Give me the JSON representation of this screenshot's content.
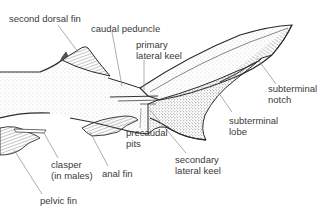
{
  "figure": {
    "labels": [
      {
        "id": "second-dorsal-fin",
        "text": "second dorsal fin",
        "x": 9,
        "y": 14
      },
      {
        "id": "caudal-peduncle",
        "text": "caudal peduncle",
        "x": 91,
        "y": 24
      },
      {
        "id": "primary-lateral-keel",
        "line1": "primary",
        "line2": "lateral keel",
        "x": 136,
        "y": 40
      },
      {
        "id": "subterminal-notch",
        "line1": "subterminal",
        "line2": "notch",
        "x": 268,
        "y": 84
      },
      {
        "id": "subterminal-lobe",
        "line1": "subterminal",
        "line2": "lobe",
        "x": 229,
        "y": 116
      },
      {
        "id": "precaudal-pits",
        "line1": "precaudal",
        "line2": "pits",
        "x": 126,
        "y": 128
      },
      {
        "id": "secondary-lateral-keel",
        "line1": "secondary",
        "line2": "lateral keel",
        "x": 175,
        "y": 155
      },
      {
        "id": "clasper",
        "line1": "clasper",
        "line2": "(in males)",
        "x": 51,
        "y": 160
      },
      {
        "id": "anal-fin",
        "text": "anal fin",
        "x": 102,
        "y": 169
      },
      {
        "id": "pelvic-fin",
        "text": "pelvic fin",
        "x": 40,
        "y": 196
      }
    ]
  },
  "colors": {
    "outline": "#2a2a2a",
    "label_text": "#3a3a3a",
    "leader_line": "#8a8a8a",
    "stipple": "#c8c8c8",
    "hatch": "#6a6a6a"
  }
}
